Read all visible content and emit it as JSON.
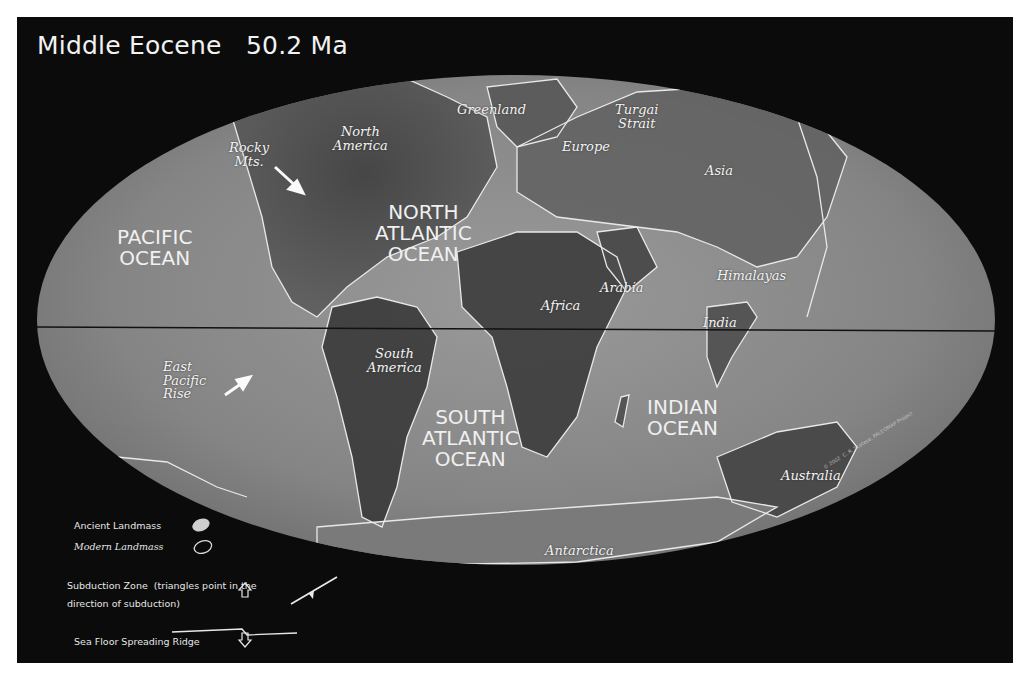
{
  "title": "Middle Eocene   50.2 Ma",
  "colors": {
    "background": "#0b0b0b",
    "ocean": "#8a8a8a",
    "ancient_land": "#4a4a4a",
    "coastline": "#e8e8e8",
    "text": "#f2f2f2"
  },
  "oceans": [
    {
      "id": "pacific",
      "text": "PACIFIC\nOCEAN"
    },
    {
      "id": "north-atlantic",
      "text": "NORTH\nATLANTIC\nOCEAN"
    },
    {
      "id": "south-atlantic",
      "text": "SOUTH\nATLANTIC\nOCEAN"
    },
    {
      "id": "indian",
      "text": "INDIAN\nOCEAN"
    }
  ],
  "regions": [
    {
      "id": "greenland",
      "text": "Greenland"
    },
    {
      "id": "turgai-strait",
      "text": "Turgai\nStrait"
    },
    {
      "id": "north-america",
      "text": "North\nAmerica"
    },
    {
      "id": "rocky-mts",
      "text": "Rocky\nMts."
    },
    {
      "id": "europe",
      "text": "Europe"
    },
    {
      "id": "asia",
      "text": "Asia"
    },
    {
      "id": "africa",
      "text": "Africa"
    },
    {
      "id": "arabia",
      "text": "Arabia"
    },
    {
      "id": "himalayas",
      "text": "Himalayas"
    },
    {
      "id": "india",
      "text": "India"
    },
    {
      "id": "south-america",
      "text": "South\nAmerica"
    },
    {
      "id": "east-pacific-rise",
      "text": "East\nPacific\nRise"
    },
    {
      "id": "australia",
      "text": "Australia"
    },
    {
      "id": "antarctica",
      "text": "Antarctica"
    }
  ],
  "legend": {
    "ancient_landmass": "Ancient Landmass",
    "modern_landmass": "Modern Landmass",
    "subduction_zone": "Subduction Zone  (triangles point in the\ndirection of subduction)",
    "spreading_ridge": "Sea Floor Spreading Ridge"
  },
  "copyright": "© 2002  C. R. Scotese, PALEOMAP Project"
}
